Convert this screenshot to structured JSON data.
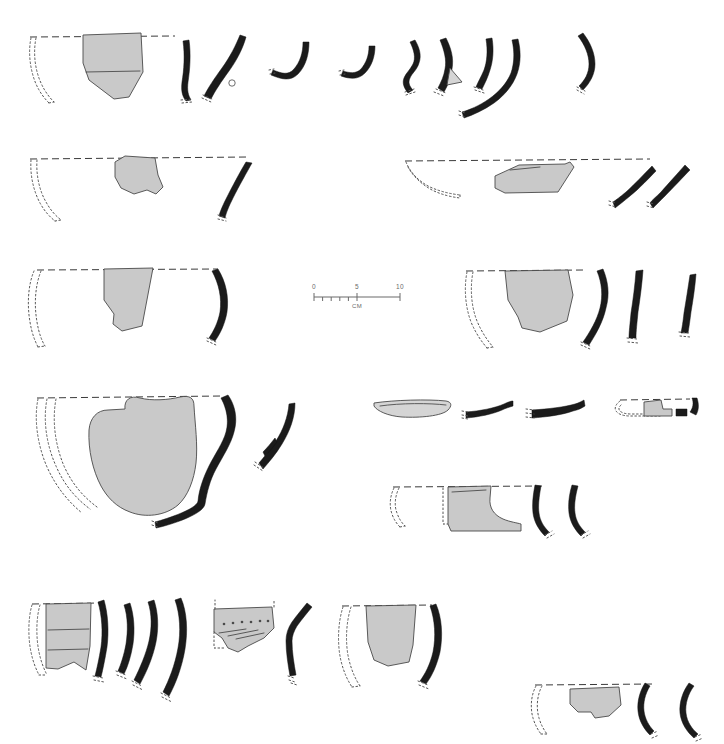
{
  "plate": {
    "type": "archaeological-pottery-profile-plate",
    "width": 724,
    "height": 744,
    "background_color": "#ffffff",
    "sherd_fill_color": "#c9c9c9",
    "profile_fill_color": "#1b1b1b",
    "line_color": "#3a3a3a",
    "reconstruction_line_style": "dotted",
    "rim_line_style": "dashed",
    "caption": ""
  },
  "scale_bar": {
    "name": "scale-bar",
    "unit_label": "CM",
    "tick_labels": [
      "0",
      "5",
      "10"
    ],
    "minor_tick_count": 10,
    "length_cm": 10,
    "x": 314,
    "y": 292,
    "pixel_length": 86
  },
  "rows": [
    {
      "id": "row-1",
      "label": "Row 1",
      "vessel_count": 9,
      "items": [
        {
          "id": "1a",
          "kind": "rim-sherd-with-reconstruction",
          "has_sherd": true,
          "has_rim_line": true
        },
        {
          "id": "1b",
          "kind": "rim-profile",
          "has_sherd": false,
          "has_rim_line": false
        },
        {
          "id": "1c",
          "kind": "rim-profile",
          "has_sherd": false,
          "has_rim_line": false
        },
        {
          "id": "1d",
          "kind": "rim-profile",
          "has_sherd": false,
          "has_rim_line": false
        },
        {
          "id": "1e",
          "kind": "rim-profile",
          "has_sherd": false,
          "has_rim_line": false
        },
        {
          "id": "1f",
          "kind": "rim-profile-with-lug",
          "has_sherd": false,
          "has_rim_line": false
        },
        {
          "id": "1g",
          "kind": "rim-profile",
          "has_sherd": false,
          "has_rim_line": false
        },
        {
          "id": "1h",
          "kind": "rim-profile",
          "has_sherd": false,
          "has_rim_line": false
        },
        {
          "id": "1i",
          "kind": "rim-profile",
          "has_sherd": false,
          "has_rim_line": false
        }
      ]
    },
    {
      "id": "row-2",
      "label": "Row 2",
      "vessel_count": 4,
      "items": [
        {
          "id": "2a",
          "kind": "rim-sherd-with-reconstruction",
          "has_sherd": true,
          "has_rim_line": true
        },
        {
          "id": "2b",
          "kind": "rim-profile",
          "has_sherd": false,
          "has_rim_line": false
        },
        {
          "id": "2c",
          "kind": "rim-sherd-with-reconstruction",
          "has_sherd": true,
          "has_rim_line": true
        },
        {
          "id": "2d",
          "kind": "rim-profile",
          "has_sherd": false,
          "has_rim_line": false
        },
        {
          "id": "2e",
          "kind": "rim-profile",
          "has_sherd": false,
          "has_rim_line": false
        }
      ]
    },
    {
      "id": "row-3",
      "label": "Row 3",
      "vessel_count": 5,
      "items": [
        {
          "id": "3a",
          "kind": "rim-sherd-with-reconstruction",
          "has_sherd": true,
          "has_rim_line": true
        },
        {
          "id": "3b",
          "kind": "rim-profile",
          "has_sherd": false,
          "has_rim_line": false
        },
        {
          "id": "3c",
          "kind": "rim-sherd-with-reconstruction",
          "has_sherd": true,
          "has_rim_line": true
        },
        {
          "id": "3d",
          "kind": "rim-profile",
          "has_sherd": false,
          "has_rim_line": false
        },
        {
          "id": "3e",
          "kind": "rim-profile",
          "has_sherd": false,
          "has_rim_line": false
        },
        {
          "id": "3f",
          "kind": "rim-profile",
          "has_sherd": false,
          "has_rim_line": false
        }
      ]
    },
    {
      "id": "row-4",
      "label": "Row 4",
      "vessel_count": 7,
      "items": [
        {
          "id": "4a",
          "kind": "large-vessel-sherd-with-reconstruction",
          "has_sherd": true,
          "has_rim_line": true
        },
        {
          "id": "4b",
          "kind": "body-profile",
          "has_sherd": false,
          "has_rim_line": false
        },
        {
          "id": "4c",
          "kind": "flat-base-sherd",
          "has_sherd": true,
          "has_rim_line": false
        },
        {
          "id": "4d",
          "kind": "flat-rim-profile",
          "has_sherd": false,
          "has_rim_line": false
        },
        {
          "id": "4e",
          "kind": "flat-rim-profile",
          "has_sherd": false,
          "has_rim_line": false
        },
        {
          "id": "4f",
          "kind": "base-sherd-with-reconstruction",
          "has_sherd": true,
          "has_rim_line": true
        },
        {
          "id": "4g",
          "kind": "base-sherd-with-reconstruction",
          "has_sherd": true,
          "has_rim_line": true
        }
      ]
    },
    {
      "id": "row-5",
      "label": "Row 5",
      "vessel_count": 8,
      "items": [
        {
          "id": "5a",
          "kind": "rim-sherd-with-reconstruction",
          "has_sherd": true,
          "has_rim_line": true
        },
        {
          "id": "5b",
          "kind": "rim-profile",
          "has_sherd": false,
          "has_rim_line": false
        },
        {
          "id": "5c",
          "kind": "rim-profile",
          "has_sherd": false,
          "has_rim_line": false
        },
        {
          "id": "5d",
          "kind": "rim-profile",
          "has_sherd": false,
          "has_rim_line": false
        },
        {
          "id": "5e",
          "kind": "rim-profile",
          "has_sherd": false,
          "has_rim_line": false
        },
        {
          "id": "5f",
          "kind": "decorated-sherd-with-punctates",
          "has_sherd": true,
          "has_rim_line": false,
          "decoration": "punctate-row"
        },
        {
          "id": "5g",
          "kind": "angled-rim-profile",
          "has_sherd": false,
          "has_rim_line": false
        },
        {
          "id": "5h",
          "kind": "rim-sherd-with-reconstruction",
          "has_sherd": true,
          "has_rim_line": true
        },
        {
          "id": "5i",
          "kind": "rim-profile",
          "has_sherd": false,
          "has_rim_line": false
        }
      ]
    },
    {
      "id": "row-6",
      "label": "Row 6",
      "vessel_count": 3,
      "items": [
        {
          "id": "6a",
          "kind": "rim-sherd-with-reconstruction",
          "has_sherd": true,
          "has_rim_line": true
        },
        {
          "id": "6b",
          "kind": "rim-profile",
          "has_sherd": false,
          "has_rim_line": false
        },
        {
          "id": "6c",
          "kind": "rim-profile",
          "has_sherd": false,
          "has_rim_line": false
        }
      ]
    }
  ]
}
